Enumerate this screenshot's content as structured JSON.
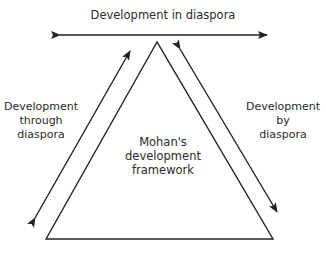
{
  "diagram": {
    "top_label": "Development in diaspora",
    "left_label": [
      "Development",
      "through",
      "diaspora"
    ],
    "right_label": [
      "Development",
      "by",
      "diaspora"
    ],
    "center_label": [
      "Mohan's",
      "development",
      "framework"
    ]
  },
  "colors": {
    "stroke": "#222222",
    "background": "#ffffff"
  }
}
